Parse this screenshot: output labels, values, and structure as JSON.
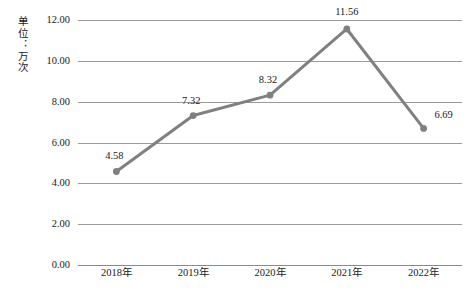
{
  "chart_data": {
    "type": "line",
    "title": "",
    "subtitle": "",
    "xlabel": "",
    "ylabel": "单位：万次",
    "categories": [
      "2018年",
      "2019年",
      "2020年",
      "2021年",
      "2022年"
    ],
    "values": [
      4.58,
      7.32,
      8.32,
      11.56,
      6.69
    ],
    "series": [
      {
        "name": "",
        "values": [
          4.58,
          7.32,
          8.32,
          11.56,
          6.69
        ],
        "color": "#808080",
        "marker": "circle",
        "show_labels": true
      }
    ],
    "ylim": [
      0.0,
      12.0
    ],
    "ytick_step": 2.0,
    "yticks": [
      "0.00",
      "2.00",
      "4.00",
      "6.00",
      "8.00",
      "10.00",
      "12.00"
    ],
    "ytick_values": [
      0,
      2,
      4,
      6,
      8,
      10,
      12
    ],
    "data_labels": [
      "4.58",
      "7.32",
      "8.32",
      "11.56",
      "6.69"
    ],
    "grid": true,
    "grid_axis": "y",
    "grid_color": "#9a9a9a",
    "legend": false,
    "legend_position": "none",
    "background": "#ffffff",
    "line_color": "#808080",
    "text_color": "#1a1a1a"
  },
  "axis": {
    "unit_label": "单位：万次"
  }
}
